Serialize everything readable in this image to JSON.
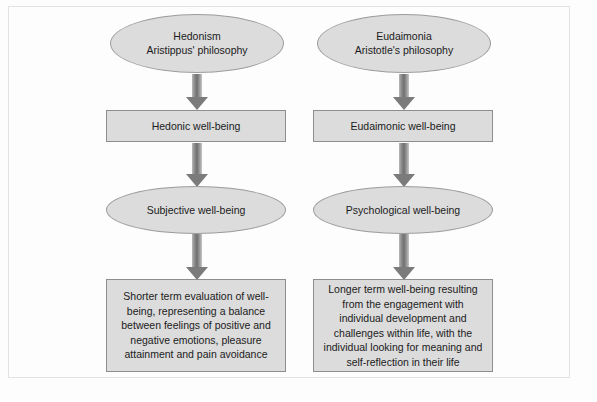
{
  "diagram": {
    "colors": {
      "node_fill": "#dcdcdc",
      "node_stroke": "#9a9a9a",
      "arrow_fill": "#7b7b7b",
      "frame_stroke": "#e2e2e2",
      "background": "#fdfdfd",
      "text": "#1b1b1b"
    },
    "columns": [
      {
        "id": "hedonic",
        "stages": [
          {
            "shape": "ellipse",
            "text": "Hedonism\nAristippus' philosophy"
          },
          {
            "shape": "rectangle",
            "text": "Hedonic well-being"
          },
          {
            "shape": "ellipse",
            "text": "Subjective well-being"
          },
          {
            "shape": "rectangle",
            "text": "Shorter term evaluation of well-being, representing a balance between feelings of positive and negative emotions, pleasure attainment and pain avoidance"
          }
        ]
      },
      {
        "id": "eudaimonic",
        "stages": [
          {
            "shape": "ellipse",
            "text": "Eudaimonia\nAristotle's philosophy"
          },
          {
            "shape": "rectangle",
            "text": "Eudaimonic well-being"
          },
          {
            "shape": "ellipse",
            "text": "Psychological well-being"
          },
          {
            "shape": "rectangle",
            "text": "Longer term well-being resulting from the engagement with individual development and challenges within life, with the individual looking for meaning and self-reflection in their life"
          }
        ]
      }
    ],
    "connectors": [
      {
        "from": "hedonism",
        "to": "hedonic-well-being",
        "type": "block-arrow-down"
      },
      {
        "from": "hedonic-well-being",
        "to": "subjective-well-being",
        "type": "block-arrow-down"
      },
      {
        "from": "subjective-well-being",
        "to": "hedonic-description",
        "type": "block-arrow-down"
      },
      {
        "from": "eudaimonia",
        "to": "eudaimonic-well-being",
        "type": "block-arrow-down"
      },
      {
        "from": "eudaimonic-well-being",
        "to": "psychological-well-being",
        "type": "block-arrow-down"
      },
      {
        "from": "psychological-well-being",
        "to": "eudaimonic-description",
        "type": "block-arrow-down"
      }
    ]
  }
}
